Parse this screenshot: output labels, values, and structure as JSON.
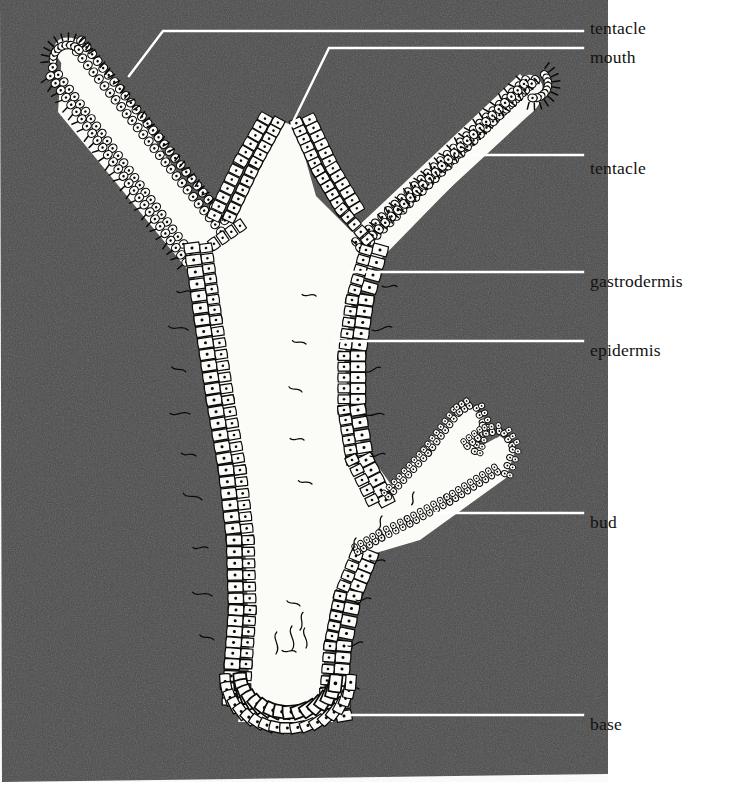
{
  "figure": {
    "panel": {
      "background_color": "#4a4a4a",
      "page_color": "#ffffff",
      "x": 0,
      "y": 0,
      "width": 608,
      "height": 778
    },
    "organism_colors": {
      "cell_fill": "#fbfbf7",
      "cell_outline": "#0a0a0a",
      "cavity_fill": "#fbfbf7",
      "leader_line": "#ffffff"
    }
  },
  "labels": [
    {
      "id": "tentacle-left",
      "text": "tentacle",
      "text_x": 590,
      "text_y": 22,
      "leader": "M 129,76 L 163,31 L 583,31",
      "anchor_x": 129,
      "anchor_y": 76
    },
    {
      "id": "mouth",
      "text": "mouth",
      "text_x": 590,
      "text_y": 51,
      "leader": "M 289,130 L 329,48 L 583,48",
      "anchor_x": 289,
      "anchor_y": 130
    },
    {
      "id": "tentacle-right",
      "text": "tentacle",
      "text_x": 590,
      "text_y": 162,
      "leader": "M 474,155 L 583,155",
      "anchor_x": 474,
      "anchor_y": 155
    },
    {
      "id": "gastrodermis",
      "text": "gastrodermis",
      "text_x": 590,
      "text_y": 275,
      "leader": "M 349,272 L 583,272",
      "anchor_x": 349,
      "anchor_y": 272
    },
    {
      "id": "epidermis",
      "text": "epidermis",
      "text_x": 590,
      "text_y": 344,
      "leader": "M 335,341 L 583,341",
      "anchor_x": 335,
      "anchor_y": 341
    },
    {
      "id": "bud",
      "text": "bud",
      "text_x": 590,
      "text_y": 516,
      "leader": "M 435,513 L 583,513",
      "anchor_x": 435,
      "anchor_y": 513
    },
    {
      "id": "base",
      "text": "base",
      "text_x": 590,
      "text_y": 718,
      "leader": "M 352,715 L 583,715",
      "anchor_x": 352,
      "anchor_y": 715
    }
  ],
  "anatomy": {
    "parts": [
      "tentacle-left",
      "tentacle-right",
      "mouth",
      "hypostome",
      "gastric-cavity",
      "body-column",
      "gastrodermis",
      "epidermis",
      "bud",
      "bud-tentacles",
      "base"
    ]
  }
}
